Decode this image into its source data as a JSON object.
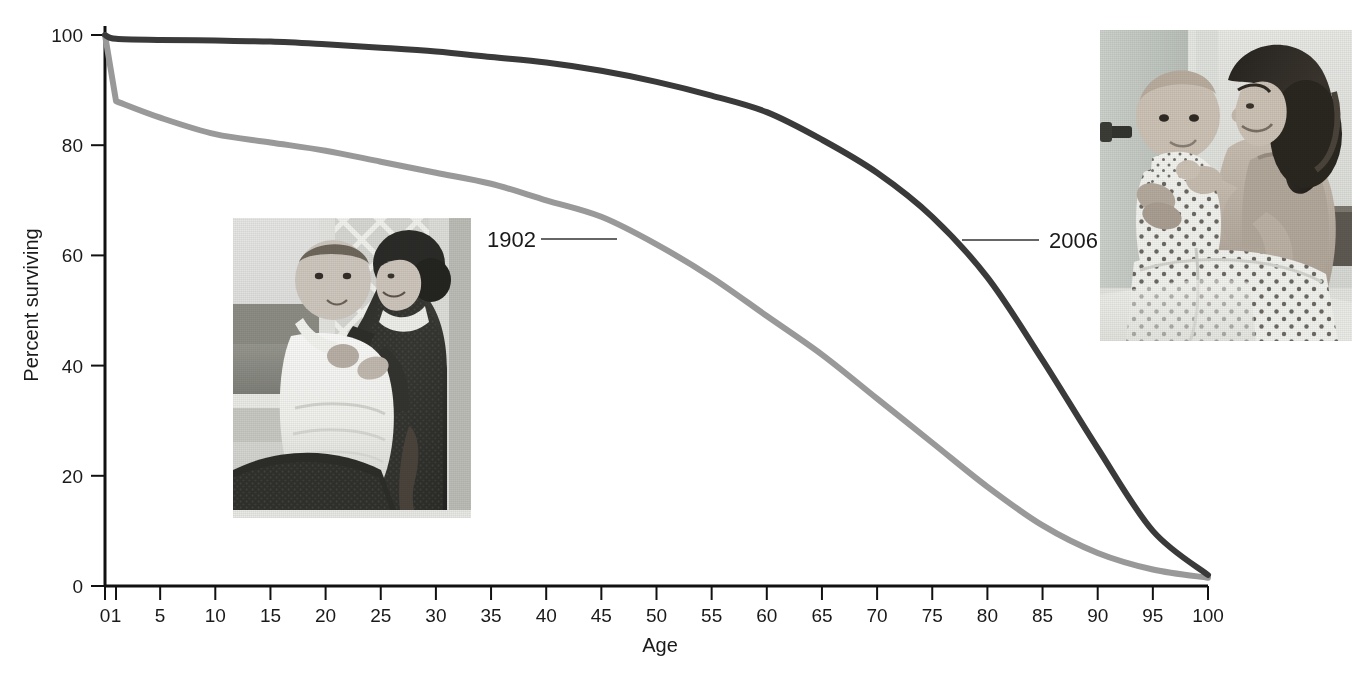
{
  "chart_data": {
    "type": "line",
    "title": "",
    "xlabel": "Age",
    "ylabel": "Percent surviving",
    "xlim": [
      0,
      100
    ],
    "ylim": [
      0,
      100
    ],
    "grid": false,
    "legend_position": "inline-annotations",
    "x_tick_labels": [
      "0",
      "1",
      "5",
      "10",
      "15",
      "20",
      "25",
      "30",
      "35",
      "40",
      "45",
      "50",
      "55",
      "60",
      "65",
      "70",
      "75",
      "80",
      "85",
      "90",
      "95",
      "100"
    ],
    "x_tick_values": [
      0,
      1,
      5,
      10,
      15,
      20,
      25,
      30,
      35,
      40,
      45,
      50,
      55,
      60,
      65,
      70,
      75,
      80,
      85,
      90,
      95,
      100
    ],
    "y_tick_labels": [
      "0",
      "20",
      "40",
      "60",
      "80",
      "100"
    ],
    "y_tick_values": [
      0,
      20,
      40,
      60,
      80,
      100
    ],
    "series": [
      {
        "name": "1902",
        "color": "#999999",
        "x": [
          0,
          1,
          5,
          10,
          15,
          20,
          25,
          30,
          35,
          40,
          45,
          50,
          55,
          60,
          65,
          70,
          75,
          80,
          85,
          90,
          95,
          100
        ],
        "values": [
          100,
          88,
          85,
          82,
          80.5,
          79,
          77,
          75,
          73,
          70,
          67,
          62,
          56,
          49,
          42,
          34,
          26,
          18,
          11,
          6,
          3,
          1.5
        ]
      },
      {
        "name": "2006",
        "color": "#3a3a3a",
        "x": [
          0,
          1,
          5,
          10,
          15,
          20,
          25,
          30,
          35,
          40,
          45,
          50,
          55,
          60,
          65,
          70,
          75,
          80,
          85,
          90,
          95,
          100
        ],
        "values": [
          100,
          99.3,
          99.1,
          99,
          98.8,
          98.3,
          97.7,
          97,
          96,
          95,
          93.5,
          91.5,
          89,
          86,
          81,
          75,
          67,
          56,
          41,
          25,
          10,
          2
        ]
      }
    ],
    "annotations": [
      {
        "label": "1902",
        "target_x": 47,
        "target_y": 64
      },
      {
        "label": "2006",
        "target_x": 78,
        "target_y": 62
      }
    ]
  },
  "axes": {
    "x_title": "Age",
    "y_title": "Percent surviving"
  },
  "series_labels": {
    "left": "1902",
    "right": "2006"
  },
  "photos": {
    "historic": {
      "name": "mother-and-baby-1902",
      "alt": "Black and white photograph of a woman in a dark high-collared dress holding an infant in a white christening gown on a porch"
    },
    "modern": {
      "name": "mother-and-baby-2006",
      "alt": "Grayscale photograph of a smiling woman with long dark hair holding a baby in a polka-dot outfit while seated on a bed"
    }
  }
}
